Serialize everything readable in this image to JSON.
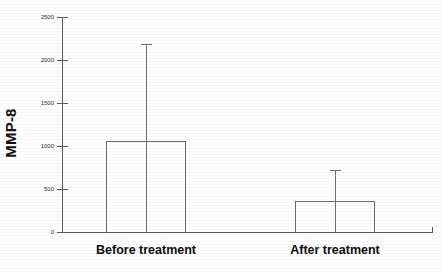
{
  "chart_data": {
    "type": "bar",
    "title": "",
    "xlabel": "",
    "ylabel": "MMP-8",
    "categories": [
      "Before treatment",
      "After treatment"
    ],
    "values": [
      1060,
      360
    ],
    "error_high": [
      2185,
      725
    ],
    "ylim": [
      0,
      2500
    ],
    "yticks": [
      0,
      500,
      1000,
      1500,
      2000,
      2500
    ],
    "ytick_labels": [
      "0",
      "500",
      "1000",
      "1500",
      "2000",
      "2500"
    ],
    "grid": false,
    "legend": "none",
    "series": [
      {
        "name": "MMP-8",
        "values": [
          1060,
          360
        ],
        "error_high": [
          2185,
          725
        ]
      }
    ],
    "style": {
      "bar_fill": "#ffffff",
      "bar_stroke": "#6b6b6b",
      "axis_color": "#5a5a5a",
      "background": "#ffffff",
      "text_color": "#111111"
    }
  }
}
